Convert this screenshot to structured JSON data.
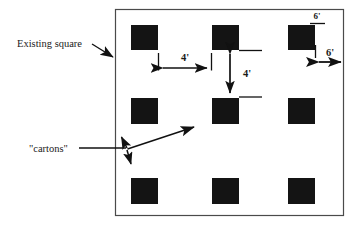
{
  "figure": {
    "background_color": "#ffffff",
    "line_color": "#3a3a3a",
    "carton_fill": "#141414",
    "text_color": "#1a1a1a"
  },
  "enclosure": {
    "name": "Existing square",
    "border_label": "Existing square"
  },
  "labels": {
    "existing_square": "Existing square",
    "cartons": "\"cartons\""
  },
  "dimensions": [
    {
      "id": "horizontal-gap",
      "value": "4'",
      "orientation": "horizontal",
      "between": "columns"
    },
    {
      "id": "vertical-gap",
      "value": "4'",
      "orientation": "vertical",
      "between": "rows"
    },
    {
      "id": "top-clearance",
      "value": "6'",
      "orientation": "vertical",
      "between": "top-edge-and-carton"
    },
    {
      "id": "right-clearance",
      "value": "6'",
      "orientation": "horizontal",
      "between": "carton-and-right-edge"
    }
  ],
  "cartons": {
    "count": 9,
    "rows": 3,
    "columns": 3,
    "fill": "#141414",
    "size_px": 27,
    "positions": [
      {
        "x": 131,
        "y": 25
      },
      {
        "x": 212,
        "y": 25
      },
      {
        "x": 288,
        "y": 25
      },
      {
        "x": 131,
        "y": 98
      },
      {
        "x": 212,
        "y": 98
      },
      {
        "x": 288,
        "y": 98
      },
      {
        "x": 131,
        "y": 178
      },
      {
        "x": 212,
        "y": 178
      },
      {
        "x": 288,
        "y": 178
      }
    ]
  },
  "callouts": [
    {
      "id": "existing-square-callout",
      "label": "Existing square",
      "points_to": "enclosure-left-border"
    },
    {
      "id": "cartons-callout",
      "label": "\"cartons\"",
      "points_to": "cartons-group",
      "arrow_count": 3
    }
  ]
}
